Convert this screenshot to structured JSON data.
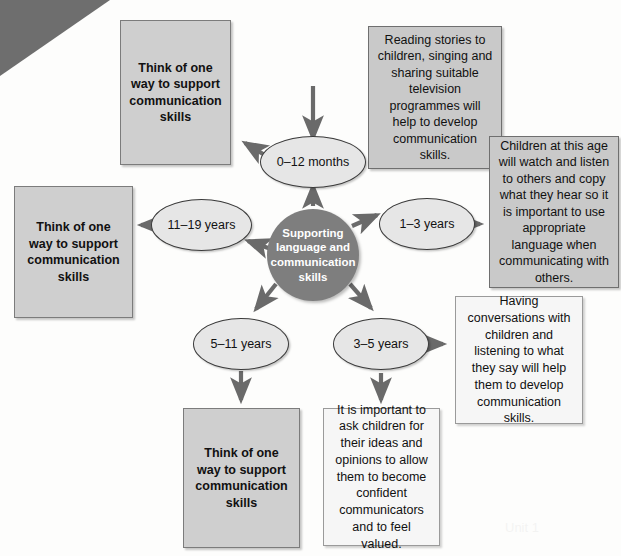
{
  "diagram": {
    "title": "Supporting language and communication skills",
    "hub": {
      "label": "Supporting language and communication skills",
      "fill": "#7e7e7e",
      "text_color": "#ffffff"
    },
    "colors": {
      "grey_box_fill": "#cfcfcf",
      "grey_box_border": "#7c7c7c",
      "light_box_fill": "#f6f6f6",
      "light_box_border": "#9a9a9a",
      "info_grey_fill": "#c9c9c9",
      "ellipse_fill": "#e6e6e6",
      "ellipse_border": "#3a3a3a",
      "corner_wedge": "#6e6e6e",
      "page_background": "#fdfdfc",
      "arrow": "#6a6a6a"
    },
    "age_nodes": [
      {
        "id": "age-0-12-months",
        "label": "0–12 months"
      },
      {
        "id": "age-1-3-years",
        "label": "1–3 years"
      },
      {
        "id": "age-3-5-years",
        "label": "3–5 years"
      },
      {
        "id": "age-5-11-years",
        "label": "5–11 years"
      },
      {
        "id": "age-11-19-years",
        "label": "11–19 years"
      }
    ],
    "boxes": {
      "task_top": "Think of one way to support communication skills",
      "task_left": "Think of one way to support communication skills",
      "task_bottom": "Think of one way to support communication skills",
      "info_1_3_years": "Reading stories to children, singing and sharing suitable television programmes will help to develop communication skills.",
      "info_0_12_months": "Children at this age will watch and listen to others and copy what they hear so it is important to use appropriate language when communicating with others.",
      "info_3_5_years_right": "Having conversations with children and listening to what they say will help them to develop communication skills.",
      "info_3_5_years_bottom": "It is important to ask children for their ideas and opinions to allow them to become confident communicators and to feel valued."
    }
  }
}
